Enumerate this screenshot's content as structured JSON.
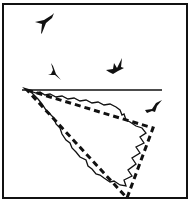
{
  "figure": {
    "stroke_color": "#111111",
    "background": "#ffffff",
    "elements": [
      {
        "name": "bird-1",
        "x": 45,
        "y": 22
      },
      {
        "name": "bird-2",
        "x": 52,
        "y": 72
      },
      {
        "name": "bird-3",
        "x": 115,
        "y": 65
      },
      {
        "name": "bird-4",
        "x": 153,
        "y": 108
      },
      {
        "name": "horizon-line"
      },
      {
        "name": "jagged-triangle"
      },
      {
        "name": "dashed-triangle"
      }
    ]
  }
}
